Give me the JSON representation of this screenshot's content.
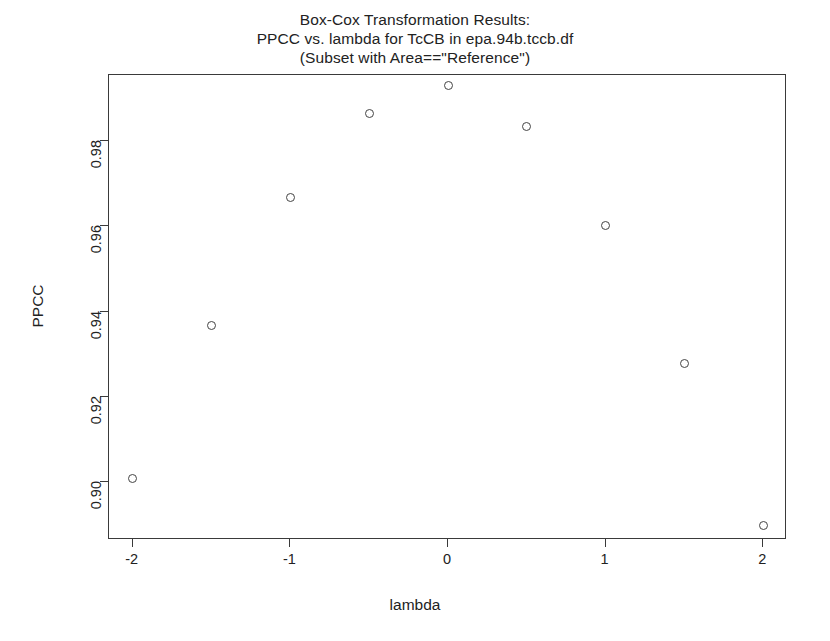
{
  "chart_data": {
    "type": "scatter",
    "title": "Box-Cox Transformation Results:\nPPCC vs. lambda for TcCB in epa.94b.tccb.df\n(Subset with Area==\"Reference\")",
    "title_lines": [
      "Box-Cox Transformation Results:",
      "PPCC vs. lambda for TcCB in epa.94b.tccb.df",
      "(Subset with Area==\"Reference\")"
    ],
    "xlabel": "lambda",
    "ylabel": "PPCC",
    "x": [
      -2,
      -1.5,
      -1,
      -0.5,
      0,
      0.5,
      1,
      1.5,
      2
    ],
    "values": [
      0.9008,
      0.9368,
      0.9668,
      0.9866,
      0.9932,
      0.9835,
      0.9603,
      0.9277,
      0.8898
    ],
    "series": [
      {
        "name": "PPCC",
        "marker": "open-circle",
        "color": "#444444",
        "points": [
          {
            "x": -2,
            "y": 0.9008
          },
          {
            "x": -1.5,
            "y": 0.9368
          },
          {
            "x": -1,
            "y": 0.9668
          },
          {
            "x": -0.5,
            "y": 0.9866
          },
          {
            "x": 0,
            "y": 0.9932
          },
          {
            "x": 0.5,
            "y": 0.9835
          },
          {
            "x": 1,
            "y": 0.9603
          },
          {
            "x": 1.5,
            "y": 0.9277
          },
          {
            "x": 2,
            "y": 0.8898
          }
        ]
      }
    ],
    "xlim": [
      -2.15,
      2.15
    ],
    "ylim": [
      0.8863,
      0.9956
    ],
    "xticks": [
      -2,
      -1,
      0,
      1,
      2
    ],
    "xtick_labels": [
      "-2",
      "-1",
      "0",
      "1",
      "2"
    ],
    "yticks": [
      0.9,
      0.92,
      0.94,
      0.96,
      0.98
    ],
    "ytick_labels": [
      "0.90",
      "0.92",
      "0.94",
      "0.96",
      "0.98"
    ],
    "grid": false,
    "legend": null,
    "frame": "box",
    "background": "#ffffff",
    "foreground": "#3a3a3a"
  }
}
